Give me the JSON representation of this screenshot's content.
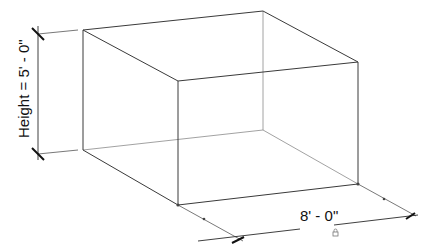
{
  "diagram": {
    "type": "isometric-box-with-dimensions",
    "colors": {
      "background": "#ffffff",
      "edge": "#3a3a3a",
      "hidden_edge": "#8a8a8a",
      "dimension": "#111111"
    },
    "dimensions": {
      "height": {
        "label": "Height = 5' - 0\"",
        "orientation": "vertical"
      },
      "width": {
        "label": "8' - 0\"",
        "orientation": "along-front-edge",
        "lock_icon": "lock-icon"
      }
    }
  }
}
